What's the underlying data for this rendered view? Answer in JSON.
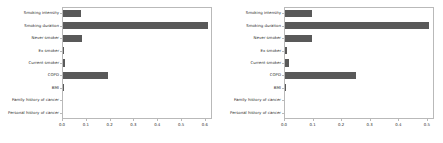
{
  "figure": {
    "background": "#ffffff",
    "bar_color": "#595959",
    "axis_color": "#b9b9b9",
    "text_color": "#2b2b2b",
    "panel_count": 2
  },
  "chart_data": [
    {
      "type": "bar",
      "orientation": "horizontal",
      "panel": "left",
      "title": "",
      "xlabel": "",
      "ylabel": "",
      "xlim": [
        0.0,
        0.63
      ],
      "grid": false,
      "legend": false,
      "categories": [
        "Smoking intensity",
        "Smoking duration",
        "Never smoker",
        "Ex smoker",
        "Current smoker",
        "COPD",
        "BMI",
        "Family history of cancer",
        "Personal history of cancer"
      ],
      "values": [
        0.075,
        0.61,
        0.078,
        0.005,
        0.007,
        0.19,
        0.003,
        0.0,
        0.0
      ],
      "xticks": [
        0.0,
        0.1,
        0.2,
        0.3,
        0.4,
        0.5,
        0.6
      ],
      "xticklabels": [
        "0.0",
        "0.1",
        "0.2",
        "0.3",
        "0.4",
        "0.5",
        "0.6"
      ]
    },
    {
      "type": "bar",
      "orientation": "horizontal",
      "panel": "right",
      "title": "",
      "xlabel": "",
      "ylabel": "",
      "xlim": [
        0.0,
        0.525
      ],
      "grid": false,
      "legend": false,
      "categories": [
        "Smoking intensity",
        "Smoking duration",
        "Never smoker",
        "Ex smoker",
        "Current smoker",
        "COPD",
        "BMI",
        "Family history of cancer",
        "Personal history of cancer"
      ],
      "values": [
        0.095,
        0.503,
        0.095,
        0.008,
        0.013,
        0.25,
        0.003,
        0.0,
        0.0
      ],
      "xticks": [
        0.0,
        0.1,
        0.2,
        0.3,
        0.4,
        0.5
      ],
      "xticklabels": [
        "0.0",
        "0.1",
        "0.2",
        "0.3",
        "0.4",
        "0.5"
      ]
    }
  ]
}
